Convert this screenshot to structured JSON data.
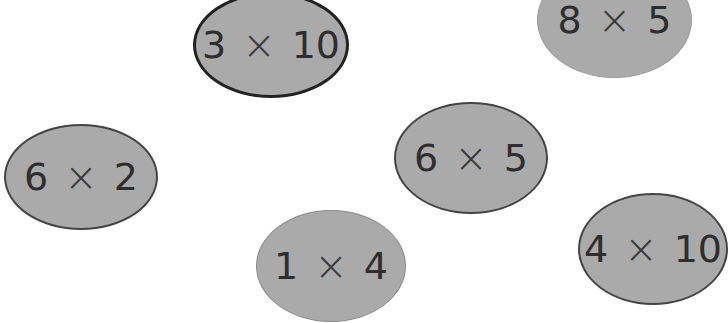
{
  "colors": {
    "background": "#ffffff",
    "bubble_fill": "#aaaaaa",
    "bubble_border": "#444444",
    "text": "#2e2e2e"
  },
  "bubbles": [
    {
      "id": "3x10",
      "left": "3",
      "operator": "×",
      "right": "10",
      "x": 193,
      "y": -8,
      "w": 156,
      "h": 106,
      "selected": true
    },
    {
      "id": "8x5",
      "left": "8",
      "operator": "×",
      "right": "5",
      "x": 537,
      "y": -38,
      "w": 155,
      "h": 116,
      "selected": false
    },
    {
      "id": "6x2",
      "left": "6",
      "operator": "×",
      "right": "2",
      "x": 4,
      "y": 124,
      "w": 154,
      "h": 106,
      "selected": false
    },
    {
      "id": "6x5",
      "left": "6",
      "operator": "×",
      "right": "5",
      "x": 394,
      "y": 102,
      "w": 154,
      "h": 112,
      "selected": false
    },
    {
      "id": "1x4",
      "left": "1",
      "operator": "×",
      "right": "4",
      "x": 256,
      "y": 210,
      "w": 150,
      "h": 112,
      "selected": false
    },
    {
      "id": "4x10",
      "left": "4",
      "operator": "×",
      "right": "10",
      "x": 578,
      "y": 193,
      "w": 150,
      "h": 112,
      "selected": false
    }
  ]
}
